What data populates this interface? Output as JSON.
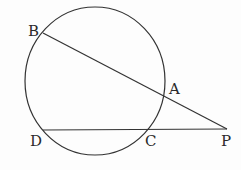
{
  "diagram": {
    "type": "geometry-secants",
    "circle": {
      "cx": 95,
      "cy": 81,
      "rx": 70,
      "ry": 74
    },
    "points": {
      "B": {
        "label": "B",
        "x": 43,
        "y": 33
      },
      "A": {
        "label": "A",
        "x": 163,
        "y": 96
      },
      "P": {
        "label": "P",
        "x": 227,
        "y": 129
      },
      "D": {
        "label": "D",
        "x": 43,
        "y": 130
      },
      "C": {
        "label": "C",
        "x": 148,
        "y": 130
      }
    },
    "segments": [
      {
        "from": "B",
        "to": "P"
      },
      {
        "from": "D",
        "to": "P"
      }
    ],
    "stroke_color": "#333333"
  }
}
